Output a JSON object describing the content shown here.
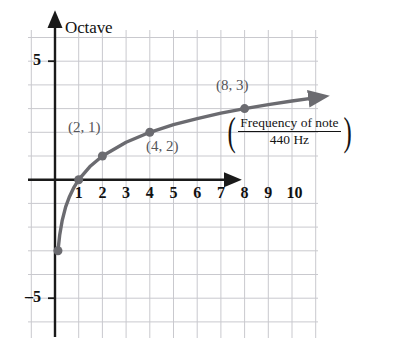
{
  "figure": {
    "background_color": "#ffffff",
    "curve_color": "#6b6b70",
    "axis_color": "#1a1a1a",
    "grid_color": "#c9c9ce",
    "label_color": "#555559"
  },
  "axes": {
    "y_axis_title": "Octave",
    "x_axis_title_numerator": "Frequency of note",
    "x_axis_title_denominator": "440 Hz",
    "left_paren": "(",
    "right_paren": ")",
    "y_tick_positive": "5",
    "y_tick_negative": "–5",
    "x_ticks": [
      "1",
      "2",
      "3",
      "4",
      "5",
      "6",
      "7",
      "8",
      "9",
      "10"
    ]
  },
  "annotations": {
    "point_2_1": "(2, 1)",
    "point_4_2": "(4, 2)",
    "point_8_3": "(8, 3)"
  },
  "chart_data": {
    "type": "line",
    "title": "",
    "subtitle": "",
    "xlabel": "Frequency of note / 440 Hz",
    "ylabel": "Octave",
    "function": "y = log2(x)",
    "xlim": [
      0,
      11
    ],
    "ylim": [
      -6,
      6
    ],
    "grid": true,
    "grid_spacing_x": 1,
    "grid_spacing_y": 1,
    "legend": "none",
    "x_tick_labels": [
      "1",
      "2",
      "3",
      "4",
      "5",
      "6",
      "7",
      "8",
      "9",
      "10"
    ],
    "x_tick_values": [
      1,
      2,
      3,
      4,
      5,
      6,
      7,
      8,
      9,
      10
    ],
    "y_tick_labels": [
      "5",
      "-5"
    ],
    "y_tick_values": [
      5,
      -5
    ],
    "series": [
      {
        "name": "Octave = log2(Frequency of note / 440 Hz)",
        "color": "#6b6b70",
        "x": [
          0.125,
          0.2,
          0.3,
          0.45,
          0.6,
          0.8,
          1,
          1.5,
          2,
          3,
          4,
          5,
          6,
          7,
          8,
          9,
          10,
          10.8
        ],
        "y": [
          -3,
          -2.32,
          -1.74,
          -1.15,
          -0.74,
          -0.32,
          0,
          0.58,
          1,
          1.58,
          2,
          2.32,
          2.58,
          2.81,
          3,
          3.17,
          3.32,
          3.43
        ],
        "arrow_end": true
      }
    ],
    "markers": [
      {
        "x": 0.125,
        "y": -3,
        "label": "",
        "labeled": false
      },
      {
        "x": 1,
        "y": 0,
        "label": "",
        "labeled": false
      },
      {
        "x": 2,
        "y": 1,
        "label": "(2, 1)",
        "labeled": true
      },
      {
        "x": 4,
        "y": 2,
        "label": "(4, 2)",
        "labeled": true
      },
      {
        "x": 8,
        "y": 3,
        "label": "(8, 3)",
        "labeled": true
      }
    ],
    "annotations": [
      {
        "text": "(2, 1)",
        "x": 1.0,
        "y": 1.55
      },
      {
        "text": "(4, 2)",
        "x": 4.0,
        "y": 0.95
      },
      {
        "text": "(8, 3)",
        "x": 7.2,
        "y": 4.0
      },
      {
        "text": "Octave",
        "x": 0.4,
        "y": 5.9
      },
      {
        "text": "(Frequency of note / 440 Hz)",
        "x": 8.6,
        "y": 1.6
      }
    ]
  }
}
